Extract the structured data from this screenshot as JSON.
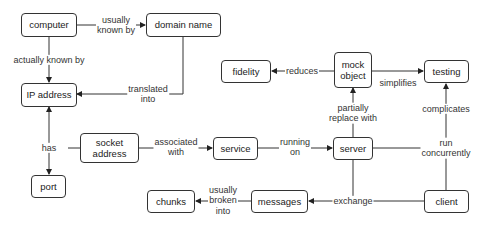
{
  "diagram": {
    "nodes": {
      "computer": "computer",
      "domain_name": "domain name",
      "ip_address": "IP address",
      "fidelity": "fidelity",
      "mock_object": "mock\nobject",
      "testing": "testing",
      "socket_address": "socket\naddress",
      "service": "service",
      "server": "server",
      "port": "port",
      "chunks": "chunks",
      "messages": "messages",
      "client": "client"
    },
    "edges": {
      "usually_known_by": "usually\nknown by",
      "actually_known_by": "actually known by",
      "translated_into": "translated\ninto",
      "reduces": "reduces",
      "simplifies": "simplifies",
      "partially_replace_with": "partially\nreplace with",
      "complicates": "complicates",
      "has": "has",
      "associated_with": "associated\nwith",
      "running_on": "running\non",
      "run_concurrently": "run\nconcurrently",
      "exchange": "exchange",
      "usually_broken_into": "usually\nbroken\ninto"
    }
  }
}
